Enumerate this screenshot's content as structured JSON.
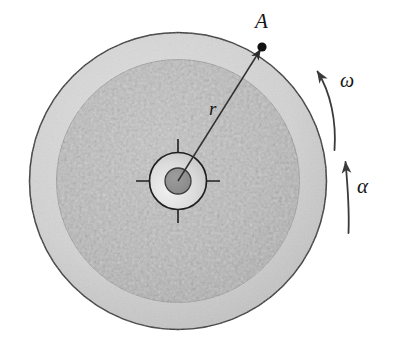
{
  "figure": {
    "background_color": "#ffffff",
    "labels": {
      "point_a": "A",
      "radius": "r",
      "angular_velocity": "ω",
      "angular_acceleration": "α"
    },
    "colors": {
      "outline": "#262626",
      "outer_ring_fill": "#cfcfcf",
      "inner_disk_fill": "#b9b9b9",
      "hub_fill": "#d6d6d6",
      "hub_core_fill": "#8f8f8f",
      "arrow_color": "#3a3a3a",
      "point_marker": "#111111"
    },
    "geometry": {
      "center_x": 178,
      "center_y": 181,
      "outer_radius": 149,
      "inner_disk_radius": 122,
      "hub_radius": 29,
      "hub_core_radius": 13,
      "crosshair_radius": 42,
      "point_a_x": 262,
      "point_a_y": 47
    },
    "annotations": [
      {
        "name": "point-a-label",
        "text": "A",
        "x": 262,
        "y": 20
      },
      {
        "name": "radius-label",
        "text": "r",
        "x": 212,
        "y": 108
      },
      {
        "name": "omega-label",
        "text": "ω",
        "x": 344,
        "y": 77
      },
      {
        "name": "alpha-label",
        "text": "α",
        "x": 360,
        "y": 183
      }
    ]
  }
}
